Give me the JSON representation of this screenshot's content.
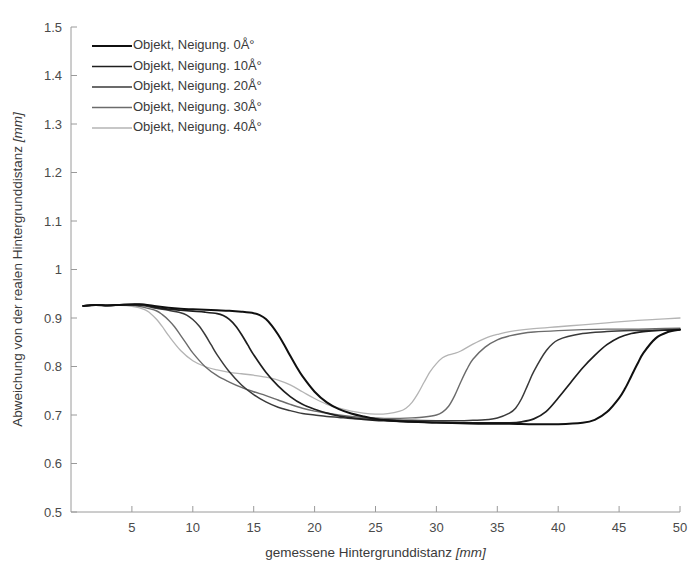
{
  "chart_data": {
    "type": "line",
    "title": "",
    "xlabel": "gemessene Hintergrunddistanz [mm]",
    "xlabel_main": "gemessene Hintergrunddistanz ",
    "xlabel_unit": "[mm]",
    "ylabel": "Abweichung von der realen Hintergrunddistanz [mm]",
    "ylabel_main": "Abweichung von der realen Hintergrunddistanz ",
    "ylabel_unit": "[mm]",
    "xlim": [
      0,
      50
    ],
    "ylim": [
      0.5,
      1.5
    ],
    "xticks": [
      5,
      10,
      15,
      20,
      25,
      30,
      35,
      40,
      45,
      50
    ],
    "xtick_labels": [
      "5",
      "10",
      "15",
      "20",
      "25",
      "30",
      "35",
      "40",
      "45",
      "50"
    ],
    "yticks": [
      0.5,
      0.6,
      0.7,
      0.8,
      0.9,
      1.0,
      1.1,
      1.2,
      1.3,
      1.4,
      1.5
    ],
    "ytick_labels": [
      "0.5",
      "0.6",
      "0.7",
      "0.8",
      "0.9",
      "1",
      "1.1",
      "1.2",
      "1.3",
      "1.4",
      "1.5"
    ],
    "grid": false,
    "legend_position": "top-left",
    "series": [
      {
        "name": "Objekt, Neigung. 0Å°",
        "color": "#101010",
        "width": 2.0,
        "x": [
          1.0,
          2.0,
          3.0,
          4.0,
          5.0,
          6.0,
          7.0,
          8.0,
          9.0,
          10.0,
          11.0,
          12.0,
          13.0,
          14.0,
          15.0,
          15.5,
          16.0,
          16.5,
          17.0,
          17.5,
          18.0,
          18.5,
          19.0,
          20.0,
          21.0,
          22.0,
          23.0,
          24.0,
          25.0,
          26.0,
          27.0,
          28.0,
          29.0,
          30.0,
          32.0,
          34.0,
          36.0,
          38.0,
          40.0,
          42.0,
          43.0,
          44.0,
          45.0,
          45.5,
          46.0,
          46.5,
          47.0,
          48.0,
          49.0,
          50.0
        ],
        "y": [
          0.925,
          0.927,
          0.926,
          0.927,
          0.928,
          0.928,
          0.924,
          0.921,
          0.919,
          0.918,
          0.917,
          0.916,
          0.915,
          0.913,
          0.91,
          0.906,
          0.898,
          0.884,
          0.866,
          0.845,
          0.822,
          0.8,
          0.78,
          0.748,
          0.726,
          0.712,
          0.703,
          0.697,
          0.692,
          0.689,
          0.687,
          0.686,
          0.685,
          0.684,
          0.683,
          0.682,
          0.682,
          0.681,
          0.681,
          0.684,
          0.69,
          0.706,
          0.735,
          0.755,
          0.78,
          0.805,
          0.828,
          0.858,
          0.871,
          0.876
        ]
      },
      {
        "name": "Objekt, Neigung. 10Å°",
        "color": "#1e1e1e",
        "width": 1.7,
        "x": [
          1.0,
          2.0,
          3.0,
          4.0,
          5.0,
          6.0,
          7.0,
          8.0,
          9.0,
          10.0,
          11.0,
          12.0,
          12.5,
          13.0,
          13.5,
          14.0,
          14.5,
          15.0,
          16.0,
          17.0,
          18.0,
          19.0,
          20.0,
          21.0,
          22.0,
          23.0,
          24.0,
          25.0,
          26.0,
          27.0,
          28.0,
          30.0,
          32.0,
          34.0,
          36.0,
          37.0,
          38.0,
          39.0,
          40.0,
          41.0,
          42.0,
          43.0,
          44.0,
          45.0,
          46.0,
          47.0,
          48.0,
          49.0,
          50.0
        ],
        "y": [
          0.925,
          0.927,
          0.926,
          0.927,
          0.928,
          0.927,
          0.922,
          0.918,
          0.916,
          0.914,
          0.912,
          0.909,
          0.905,
          0.897,
          0.884,
          0.866,
          0.845,
          0.824,
          0.788,
          0.76,
          0.738,
          0.722,
          0.712,
          0.704,
          0.698,
          0.694,
          0.691,
          0.689,
          0.688,
          0.687,
          0.686,
          0.685,
          0.684,
          0.684,
          0.684,
          0.686,
          0.692,
          0.707,
          0.735,
          0.766,
          0.797,
          0.823,
          0.845,
          0.86,
          0.868,
          0.872,
          0.874,
          0.875,
          0.876
        ]
      },
      {
        "name": "Objekt, Neigung. 20Å°",
        "color": "#3a3a3a",
        "width": 1.5,
        "x": [
          1.0,
          2.0,
          3.0,
          4.0,
          5.0,
          6.0,
          7.0,
          8.0,
          9.0,
          9.5,
          10.0,
          10.5,
          11.0,
          11.5,
          12.0,
          13.0,
          14.0,
          15.0,
          16.0,
          17.0,
          18.0,
          19.0,
          20.0,
          21.0,
          22.0,
          23.0,
          24.0,
          25.0,
          26.0,
          28.0,
          30.0,
          31.0,
          32.0,
          33.0,
          34.0,
          35.0,
          36.0,
          36.5,
          37.0,
          37.5,
          38.0,
          39.0,
          40.0,
          42.0,
          44.0,
          46.0,
          48.0,
          50.0
        ],
        "y": [
          0.925,
          0.927,
          0.926,
          0.927,
          0.927,
          0.925,
          0.92,
          0.916,
          0.911,
          0.906,
          0.897,
          0.884,
          0.866,
          0.845,
          0.824,
          0.789,
          0.762,
          0.742,
          0.727,
          0.716,
          0.709,
          0.703,
          0.7,
          0.697,
          0.695,
          0.693,
          0.692,
          0.691,
          0.69,
          0.689,
          0.688,
          0.688,
          0.688,
          0.689,
          0.69,
          0.694,
          0.704,
          0.714,
          0.734,
          0.762,
          0.79,
          0.832,
          0.855,
          0.868,
          0.872,
          0.874,
          0.875,
          0.876
        ]
      },
      {
        "name": "Objekt, Neigung. 30Å°",
        "color": "#6b6b6b",
        "width": 1.4,
        "x": [
          1.0,
          2.0,
          3.0,
          4.0,
          5.0,
          6.0,
          7.0,
          7.5,
          8.0,
          8.5,
          9.0,
          9.5,
          10.0,
          11.0,
          12.0,
          13.0,
          14.0,
          15.0,
          16.0,
          17.0,
          18.0,
          19.0,
          20.0,
          21.0,
          22.0,
          23.0,
          24.0,
          25.0,
          26.0,
          27.0,
          28.0,
          29.0,
          30.0,
          30.5,
          31.0,
          31.5,
          32.0,
          32.5,
          33.0,
          34.0,
          35.0,
          36.0,
          37.0,
          38.0,
          40.0,
          42.0,
          44.0,
          46.0,
          48.0,
          50.0
        ],
        "y": [
          0.925,
          0.927,
          0.926,
          0.927,
          0.926,
          0.922,
          0.915,
          0.907,
          0.896,
          0.882,
          0.864,
          0.846,
          0.828,
          0.8,
          0.781,
          0.768,
          0.757,
          0.748,
          0.74,
          0.731,
          0.722,
          0.714,
          0.708,
          0.704,
          0.7,
          0.697,
          0.695,
          0.694,
          0.693,
          0.693,
          0.694,
          0.696,
          0.7,
          0.706,
          0.718,
          0.74,
          0.768,
          0.794,
          0.815,
          0.84,
          0.855,
          0.863,
          0.868,
          0.871,
          0.874,
          0.876,
          0.877,
          0.877,
          0.878,
          0.879
        ]
      },
      {
        "name": "Objekt, Neigung. 40Å°",
        "color": "#b4b4b4",
        "width": 1.3,
        "x": [
          1.0,
          2.0,
          3.0,
          4.0,
          5.0,
          6.0,
          6.5,
          7.0,
          7.5,
          8.0,
          9.0,
          10.0,
          11.0,
          12.0,
          13.0,
          14.0,
          15.0,
          16.0,
          17.0,
          18.0,
          19.0,
          20.0,
          21.0,
          22.0,
          23.0,
          24.0,
          25.0,
          26.0,
          27.0,
          27.5,
          28.0,
          28.5,
          29.0,
          29.5,
          30.0,
          30.5,
          31.0,
          31.5,
          32.0,
          33.0,
          34.0,
          35.0,
          36.0,
          38.0,
          40.0,
          42.0,
          44.0,
          46.0,
          48.0,
          50.0
        ],
        "y": [
          0.924,
          0.926,
          0.925,
          0.926,
          0.924,
          0.918,
          0.91,
          0.898,
          0.882,
          0.864,
          0.833,
          0.812,
          0.8,
          0.793,
          0.788,
          0.785,
          0.782,
          0.778,
          0.772,
          0.762,
          0.748,
          0.734,
          0.722,
          0.714,
          0.708,
          0.704,
          0.702,
          0.703,
          0.708,
          0.714,
          0.726,
          0.745,
          0.768,
          0.79,
          0.806,
          0.818,
          0.824,
          0.827,
          0.832,
          0.846,
          0.858,
          0.866,
          0.872,
          0.878,
          0.882,
          0.886,
          0.89,
          0.894,
          0.897,
          0.9
        ]
      }
    ]
  },
  "legend": {
    "entries": [
      {
        "label": "Objekt, Neigung. 0Å°"
      },
      {
        "label": "Objekt, Neigung. 10Å°"
      },
      {
        "label": "Objekt, Neigung. 20Å°"
      },
      {
        "label": "Objekt, Neigung. 30Å°"
      },
      {
        "label": "Objekt, Neigung. 40Å°"
      }
    ]
  }
}
